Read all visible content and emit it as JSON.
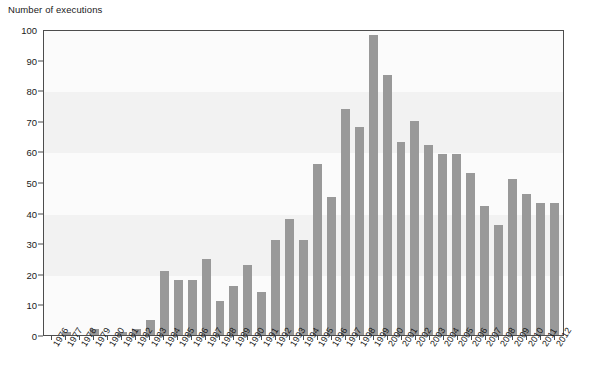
{
  "chart_data": {
    "type": "bar",
    "title": "",
    "ylabel": "Number of executions",
    "xlabel": "",
    "ylim": [
      0,
      100
    ],
    "ytick_values": [
      0,
      10,
      20,
      30,
      40,
      50,
      60,
      70,
      80,
      90,
      100
    ],
    "ytick_labels": [
      "0",
      "10",
      "20",
      "30",
      "40",
      "50",
      "60",
      "70",
      "80",
      "90",
      "100"
    ],
    "grid": "horizontal-bands",
    "legend": "none",
    "bar_color": "#999999",
    "axis_color": "#4d4d4d",
    "band_color": "#f2f2f2",
    "categories": [
      "1976",
      "1977",
      "1978",
      "1979",
      "1980",
      "1981",
      "1982",
      "1983",
      "1984",
      "1985",
      "1986",
      "1987",
      "1988",
      "1989",
      "1990",
      "1991",
      "1992",
      "1993",
      "1994",
      "1995",
      "1996",
      "1997",
      "1998",
      "1999",
      "2000",
      "2001",
      "2002",
      "2003",
      "2004",
      "2005",
      "2006",
      "2007",
      "2008",
      "2009",
      "2010",
      "2011",
      "2012"
    ],
    "values": [
      0,
      1,
      0,
      2,
      0,
      1,
      2,
      5,
      21,
      18,
      18,
      25,
      11,
      16,
      23,
      14,
      31,
      38,
      31,
      56,
      45,
      74,
      68,
      98,
      85,
      63,
      70,
      62,
      59,
      59,
      53,
      42,
      36,
      51,
      46,
      43,
      43
    ]
  }
}
